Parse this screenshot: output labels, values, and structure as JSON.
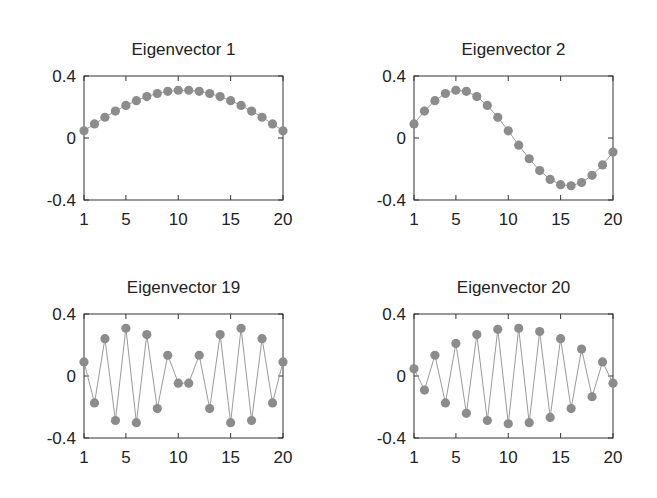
{
  "figure": {
    "background": "#ffffff",
    "marker_color": "#8c8c8c",
    "line_color": "#9a9a9a"
  },
  "chart_data": [
    {
      "type": "line",
      "title": "Eigenvector 1",
      "xlabel": "",
      "ylabel": "",
      "x": [
        1,
        2,
        3,
        4,
        5,
        6,
        7,
        8,
        9,
        10,
        11,
        12,
        13,
        14,
        15,
        16,
        17,
        18,
        19,
        20
      ],
      "values": [
        0.046,
        0.091,
        0.134,
        0.174,
        0.21,
        0.241,
        0.267,
        0.287,
        0.301,
        0.308,
        0.308,
        0.301,
        0.287,
        0.267,
        0.241,
        0.21,
        0.174,
        0.134,
        0.091,
        0.046
      ],
      "xticks": [
        "1",
        "5",
        "10",
        "15",
        "20"
      ],
      "yticks": [
        "0.4",
        "0",
        "-0.4"
      ],
      "xlim": [
        1,
        20
      ],
      "ylim": [
        -0.4,
        0.4
      ],
      "grid": false,
      "legend": null
    },
    {
      "type": "line",
      "title": "Eigenvector 2",
      "xlabel": "",
      "ylabel": "",
      "x": [
        1,
        2,
        3,
        4,
        5,
        6,
        7,
        8,
        9,
        10,
        11,
        12,
        13,
        14,
        15,
        16,
        17,
        18,
        19,
        20
      ],
      "values": [
        0.091,
        0.174,
        0.241,
        0.287,
        0.308,
        0.301,
        0.267,
        0.21,
        0.134,
        0.046,
        -0.046,
        -0.134,
        -0.21,
        -0.267,
        -0.301,
        -0.308,
        -0.287,
        -0.241,
        -0.174,
        -0.091
      ],
      "xticks": [
        "1",
        "5",
        "10",
        "15",
        "20"
      ],
      "yticks": [
        "0.4",
        "0",
        "-0.4"
      ],
      "xlim": [
        1,
        20
      ],
      "ylim": [
        -0.4,
        0.4
      ],
      "grid": false,
      "legend": null
    },
    {
      "type": "line",
      "title": "Eigenvector 19",
      "xlabel": "",
      "ylabel": "",
      "x": [
        1,
        2,
        3,
        4,
        5,
        6,
        7,
        8,
        9,
        10,
        11,
        12,
        13,
        14,
        15,
        16,
        17,
        18,
        19,
        20
      ],
      "values": [
        0.091,
        -0.174,
        0.241,
        -0.287,
        0.308,
        -0.301,
        0.267,
        -0.21,
        0.134,
        -0.046,
        -0.046,
        0.134,
        -0.21,
        0.267,
        -0.301,
        0.308,
        -0.287,
        0.241,
        -0.174,
        0.091
      ],
      "xticks": [
        "1",
        "5",
        "10",
        "15",
        "20"
      ],
      "yticks": [
        "0.4",
        "0",
        "-0.4"
      ],
      "xlim": [
        1,
        20
      ],
      "ylim": [
        -0.4,
        0.4
      ],
      "grid": false,
      "legend": null
    },
    {
      "type": "line",
      "title": "Eigenvector 20",
      "xlabel": "",
      "ylabel": "",
      "x": [
        1,
        2,
        3,
        4,
        5,
        6,
        7,
        8,
        9,
        10,
        11,
        12,
        13,
        14,
        15,
        16,
        17,
        18,
        19,
        20
      ],
      "values": [
        0.046,
        -0.091,
        0.134,
        -0.174,
        0.21,
        -0.241,
        0.267,
        -0.287,
        0.301,
        -0.308,
        0.308,
        -0.301,
        0.287,
        -0.267,
        0.241,
        -0.21,
        0.174,
        -0.134,
        0.091,
        -0.046
      ],
      "xticks": [
        "1",
        "5",
        "10",
        "15",
        "20"
      ],
      "yticks": [
        "0.4",
        "0",
        "-0.4"
      ],
      "xlim": [
        1,
        20
      ],
      "ylim": [
        -0.4,
        0.4
      ],
      "grid": false,
      "legend": null
    }
  ]
}
